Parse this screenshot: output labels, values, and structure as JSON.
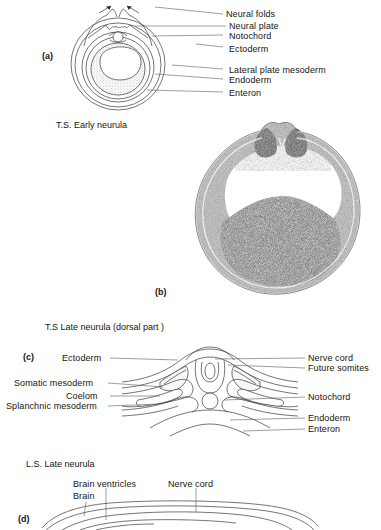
{
  "figure": {
    "title_visible": false,
    "panels": [
      {
        "id": "(a)",
        "caption": "T.S. Early neurula",
        "type": "line-diagram",
        "labels": [
          {
            "text": "Neural folds",
            "side": "right"
          },
          {
            "text": "Neural plate",
            "side": "right"
          },
          {
            "text": "Notochord",
            "side": "right"
          },
          {
            "text": "Ectoderm",
            "side": "right"
          },
          {
            "text": "Lateral plate mesoderm",
            "side": "right"
          },
          {
            "text": "Endoderm",
            "side": "right"
          },
          {
            "text": "Enteron",
            "side": "right"
          }
        ]
      },
      {
        "id": "(b)",
        "caption": "",
        "type": "photomicrograph",
        "labels": []
      },
      {
        "id": "(c)",
        "caption": "T.S Late neurula  (dorsal part )",
        "type": "line-diagram",
        "labels_left": [
          {
            "text": "Ectoderm"
          },
          {
            "text": "Somatic mesoderm"
          },
          {
            "text": "Coelom"
          },
          {
            "text": "Splanchnic mesoderm"
          }
        ],
        "labels_right": [
          {
            "text": "Nerve cord"
          },
          {
            "text": "Future somites"
          },
          {
            "text": "Notochord"
          },
          {
            "text": "Endoderm"
          },
          {
            "text": "Enteron"
          }
        ]
      },
      {
        "id": "(d)",
        "caption": "L.S. Late neurula",
        "type": "line-diagram",
        "labels": [
          {
            "text": "Brain  ventricles"
          },
          {
            "text": "Brain"
          },
          {
            "text": "Nerve cord"
          }
        ]
      }
    ]
  },
  "panel_a": {
    "id": "(a)",
    "caption": "T.S. Early neurula",
    "l_neural_folds": "Neural folds",
    "l_neural_plate": "Neural plate",
    "l_notochord": "Notochord",
    "l_ectoderm": "Ectoderm",
    "l_lateral_plate_mesoderm": "Lateral plate mesoderm",
    "l_endoderm": "Endoderm",
    "l_enteron": "Enteron"
  },
  "panel_b": {
    "id": "(b)"
  },
  "panel_c": {
    "id": "(c)",
    "caption": "T.S Late neurula  (dorsal part )",
    "l_ectoderm": "Ectoderm",
    "l_somatic_mesoderm": "Somatic mesoderm",
    "l_coelom": "Coelom",
    "l_splanchnic_mesoderm": "Splanchnic mesoderm",
    "l_nerve_cord": "Nerve cord",
    "l_future_somites": "Future somites",
    "l_notochord": "Notochord",
    "l_endoderm": "Endoderm",
    "l_enteron": "Enteron"
  },
  "panel_d": {
    "id": "(d)",
    "caption": "L.S. Late neurula",
    "l_brain_ventricles": "Brain  ventricles",
    "l_brain": "Brain",
    "l_nerve_cord": "Nerve cord"
  },
  "colors": {
    "background": "#ffffff",
    "ink": "#1a1a1a",
    "line": "#3a3a3a",
    "leader": "#5a5a5a",
    "fill_light": "#f2f2f2",
    "micrograph_dark": "#4a4a4a"
  }
}
